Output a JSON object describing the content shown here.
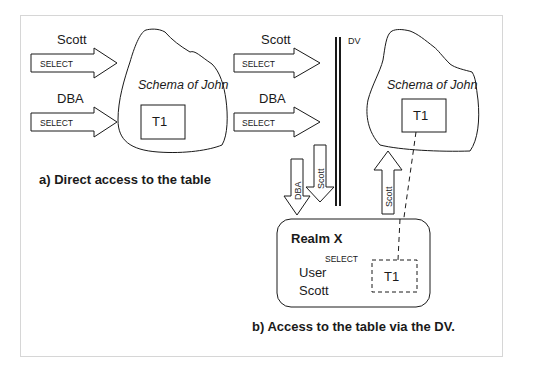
{
  "diagram": {
    "frame_border_color": "#d6d6d6",
    "stroke_color": "#1a1a1a",
    "part_a": {
      "caption": "a) Direct access to the table",
      "schema_label": "Schema of John",
      "table_label": "T1",
      "arrows": [
        {
          "user": "Scott",
          "privilege": "SELECT"
        },
        {
          "user": "DBA",
          "privilege": "SELECT"
        }
      ]
    },
    "part_b": {
      "caption": "b) Access to the table via the DV.",
      "barrier_label": "DV",
      "schema_label": "Schema of John",
      "table_label": "T1",
      "arrows": [
        {
          "user": "Scott",
          "privilege": "SELECT"
        },
        {
          "user": "DBA",
          "privilege": "SELECT"
        }
      ],
      "down_arrows": [
        {
          "label": "DBA"
        },
        {
          "label": "Scott"
        }
      ],
      "up_arrow": {
        "label": "Scott"
      },
      "realm": {
        "title": "Realm X",
        "privilege": "SELECT",
        "user_label": "User",
        "user_value": "Scott",
        "table_label": "T1"
      }
    }
  }
}
